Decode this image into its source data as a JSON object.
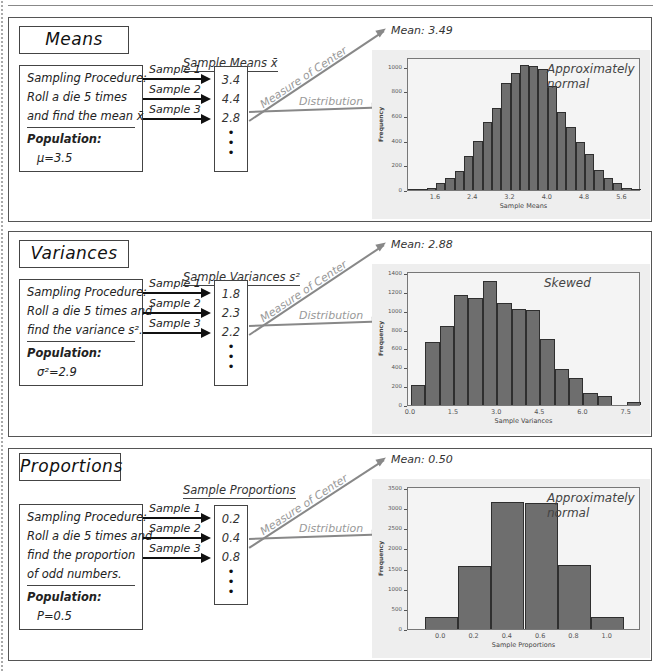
{
  "panels": [
    {
      "title": "Means",
      "column_header": "Sample Means x̄",
      "procedure_lines": [
        "Sampling Procedure:",
        "Roll a die 5 times",
        "and find the mean x̄."
      ],
      "population_label": "Population:",
      "population_value": "μ=3.5",
      "samples": [
        {
          "label": "Sample 1",
          "value": "3.4"
        },
        {
          "label": "Sample 2",
          "value": "4.4"
        },
        {
          "label": "Sample 3",
          "value": "2.8"
        }
      ],
      "dots": [
        "•",
        "•",
        "•"
      ],
      "center_label": "Measure of Center",
      "distribution_label": "Distribution",
      "mean_label": "Mean: 3.49",
      "annotation_lines": [
        "Approximately",
        "normal"
      ]
    },
    {
      "title": "Variances",
      "column_header": "Sample Variances s²",
      "procedure_lines": [
        "Sampling Procedure:",
        "Roll a die 5 times and",
        "find the variance s²."
      ],
      "population_label": "Population:",
      "population_value": "σ²=2.9",
      "samples": [
        {
          "label": "Sample 1",
          "value": "1.8"
        },
        {
          "label": "Sample 2",
          "value": "2.3"
        },
        {
          "label": "Sample 3",
          "value": "2.2"
        }
      ],
      "dots": [
        "•",
        "•",
        "•"
      ],
      "center_label": "Measure of Center",
      "distribution_label": "Distribution",
      "mean_label": "Mean: 2.88",
      "annotation_lines": [
        "Skewed"
      ]
    },
    {
      "title": "Proportions",
      "column_header": "Sample Proportions",
      "procedure_lines": [
        "Sampling Procedure:",
        "Roll a die 5 times and",
        "find the proportion",
        "of odd numbers."
      ],
      "population_label": "Population:",
      "population_value": "P=0.5",
      "samples": [
        {
          "label": "Sample 1",
          "value": "0.2"
        },
        {
          "label": "Sample 2",
          "value": "0.4"
        },
        {
          "label": "Sample 3",
          "value": "0.8"
        }
      ],
      "dots": [
        "•",
        "•",
        "•"
      ],
      "center_label": "Measure of Center",
      "distribution_label": "Distribution",
      "mean_label": "Mean: 0.50",
      "annotation_lines": [
        "Approximately",
        "normal"
      ]
    }
  ],
  "chart_data": [
    {
      "type": "bar",
      "title": "",
      "xlabel": "Sample Means",
      "ylabel": "Frequency",
      "x_ticks": [
        "1.6",
        "2.4",
        "3.2",
        "4.0",
        "4.8",
        "5.6"
      ],
      "y_ticks": [
        "0",
        "200",
        "400",
        "600",
        "800",
        "1000"
      ],
      "ylim": [
        0,
        1080
      ],
      "xlim": [
        1.0,
        6.0
      ],
      "bin_width": 0.2,
      "bin_starts": [
        1.0,
        1.2,
        1.4,
        1.6,
        1.8,
        2.0,
        2.2,
        2.4,
        2.6,
        2.8,
        3.0,
        3.2,
        3.4,
        3.6,
        3.8,
        4.0,
        4.2,
        4.4,
        4.6,
        4.8,
        5.0,
        5.2,
        5.4,
        5.6,
        5.8
      ],
      "values": [
        3,
        10,
        15,
        55,
        95,
        155,
        275,
        395,
        550,
        665,
        870,
        950,
        1015,
        1010,
        985,
        845,
        630,
        515,
        390,
        295,
        165,
        95,
        55,
        15,
        8
      ],
      "annotation": "Approximately normal"
    },
    {
      "type": "bar",
      "title": "",
      "xlabel": "Sample Variances",
      "ylabel": "Frequency",
      "x_ticks": [
        "0.0",
        "1.5",
        "3.0",
        "4.5",
        "6.0",
        "7.5"
      ],
      "y_ticks": [
        "0",
        "200",
        "400",
        "600",
        "800",
        "1000",
        "1200",
        "1400"
      ],
      "ylim": [
        0,
        1420
      ],
      "xlim": [
        -0.1,
        8.0
      ],
      "bin_width": 0.5,
      "bin_starts": [
        0.0,
        0.5,
        1.0,
        1.5,
        2.0,
        2.5,
        3.0,
        3.5,
        4.0,
        4.5,
        5.0,
        5.5,
        6.0,
        6.5,
        7.0,
        7.5
      ],
      "values": [
        210,
        665,
        840,
        1165,
        1130,
        1310,
        1080,
        1020,
        1005,
        700,
        380,
        285,
        125,
        95,
        0,
        30
      ],
      "annotation": "Skewed"
    },
    {
      "type": "bar",
      "title": "",
      "xlabel": "Sample Proportions",
      "ylabel": "Frequency",
      "x_ticks": [
        "0.0",
        "0.2",
        "0.4",
        "0.6",
        "0.8",
        "1.0"
      ],
      "y_ticks": [
        "0",
        "500",
        "1000",
        "1500",
        "2000",
        "2500",
        "3000",
        "3500"
      ],
      "ylim": [
        0,
        3550
      ],
      "xlim": [
        -0.2,
        1.2
      ],
      "bin_width": 0.2,
      "categories": [
        "0.0",
        "0.2",
        "0.4",
        "0.6",
        "0.8",
        "1.0"
      ],
      "values": [
        310,
        1570,
        3160,
        3120,
        1590,
        300
      ],
      "annotation": "Approximately normal"
    }
  ]
}
